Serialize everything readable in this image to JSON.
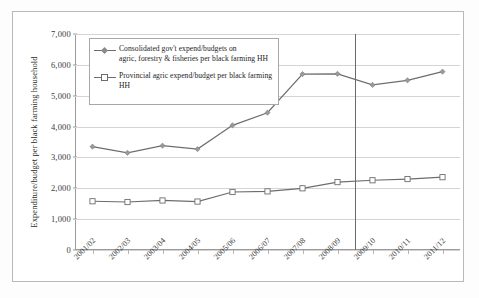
{
  "chart_data": {
    "type": "line",
    "title": "",
    "xlabel": "",
    "ylabel": "Expenditure/budget per black farming household",
    "ylim": [
      0,
      7000
    ],
    "ytick_labels": [
      "7,000",
      "6,000",
      "5,000",
      "4,000",
      "3,000",
      "2,000",
      "1,000",
      "0"
    ],
    "ytick_values": [
      7000,
      6000,
      5000,
      4000,
      3000,
      2000,
      1000,
      0
    ],
    "grid": true,
    "legend_position": "upper-left-inside",
    "categories": [
      "2001/02",
      "2002/03",
      "2003/04",
      "2004/05",
      "2005/06",
      "2006/07",
      "2007/08",
      "2008/09",
      "2009/10",
      "2010/11",
      "2011/12"
    ],
    "series": [
      {
        "name": "Consolidated gov't expend/budgets on agric, forestry & fisheries per black farming HH",
        "marker": "diamond",
        "color": "#6d6d6d",
        "values": [
          3350,
          3150,
          3380,
          3270,
          4040,
          4450,
          5700,
          5710,
          5350,
          5500,
          5780
        ]
      },
      {
        "name": "Provincial agric expend/budget per black farming HH",
        "marker": "square",
        "color": "#6d6d6d",
        "values": [
          1580,
          1555,
          1605,
          1570,
          1880,
          1900,
          2000,
          2200,
          2260,
          2300,
          2360
        ]
      }
    ],
    "annotations": [
      {
        "type": "vertical-line",
        "name": "budget-forecast-divider",
        "between": [
          "2008/09",
          "2009/10"
        ],
        "color": "#6a6a6a"
      }
    ]
  },
  "legend": {
    "entries": [
      {
        "line1": "Consolidated gov't expend/budgets on",
        "line2": "agric, forestry & fisheries per black farming HH",
        "marker": "diamond-marker-icon"
      },
      {
        "line1": "Provincial agric expend/budget per black farming",
        "line2": "HH",
        "marker": "square-marker-icon"
      }
    ]
  }
}
